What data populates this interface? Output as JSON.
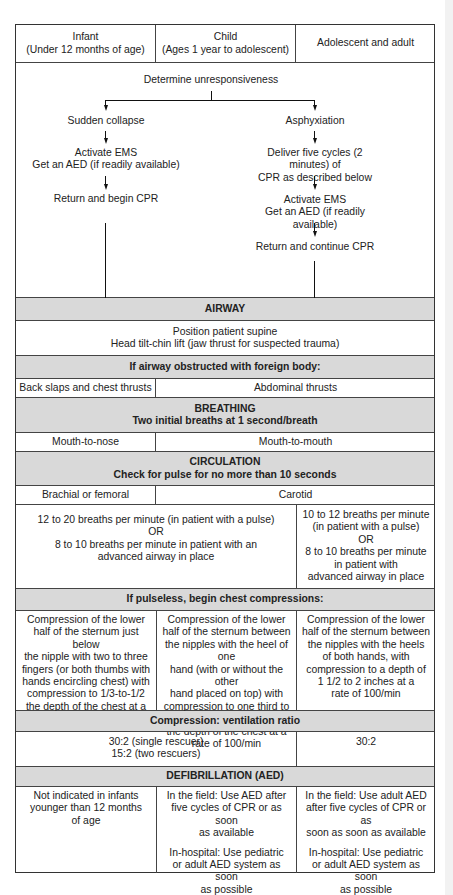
{
  "header": {
    "columns": [
      {
        "label": "Infant\n(Under 12 months of age)"
      },
      {
        "label": "Child\n(Ages 1 year to adolescent)"
      },
      {
        "label": "Adolescent and adult"
      }
    ]
  },
  "flowchart": {
    "start": "Determine unresponsiveness",
    "left_branch": {
      "title": "Sudden collapse",
      "step1": "Activate EMS\nGet an AED (if readily available)",
      "step2": "Return and begin CPR"
    },
    "right_branch": {
      "title": "Asphyxiation",
      "step1": "Deliver five cycles (2 minutes) of\nCPR as described below",
      "step2": "Activate EMS\nGet an AED (if readily available)",
      "step3": "Return and continue CPR"
    }
  },
  "airway": {
    "heading": "AIRWAY",
    "body": "Position patient supine\nHead tilt-chin lift (jaw thrust for suspected trauma)",
    "obstructed_heading": "If airway obstructed with foreign body:",
    "infant": "Back slaps and chest thrusts",
    "child_adult": "Abdominal thrusts"
  },
  "breathing": {
    "heading": "BREATHING\nTwo initial breaths at 1 second/breath",
    "infant": "Mouth-to-nose",
    "child_adult": "Mouth-to-mouth"
  },
  "circulation": {
    "heading": "CIRCULATION\nCheck for pulse for no more than 10 seconds",
    "infant": "Brachial or femoral",
    "child_adult": "Carotid",
    "rate_infant_child": "12 to 20 breaths per minute (in patient with a pulse)\nOR\n8 to 10 breaths per minute in patient with an\nadvanced airway in place",
    "rate_adult": "10 to 12 breaths per minute\n(in patient with a pulse)\nOR\n8 to 10 breaths per minute\nin patient with\nadvanced airway in place"
  },
  "compressions": {
    "heading": "If pulseless, begin chest compressions:",
    "infant": "Compression of the lower\nhalf of the sternum just below\nthe nipple with two to three\nfingers (or both thumbs with\nhands encircling chest) with\ncompression to 1/3-to-1/2\nthe depth of the chest at a\nrate of 100/min",
    "child": "Compression of the lower\nhalf of the sternum between\nthe nipples with the heel of one\nhand (with or without the other\nhand placed on top) with\ncompression to one third to half\nthe depth of the chest at a\nrate of 100/min",
    "adult": "Compression of the lower\nhalf of the sternum between\nthe nipples with the heels\nof both hands, with\ncompression to a depth of\n1 1/2 to 2 inches at a\nrate of 100/min"
  },
  "ratio": {
    "heading": "Compression: ventilation ratio",
    "infant_child": "30:2 (single rescuer)\n15:2 (two rescuers)",
    "adult": "30:2"
  },
  "defibrillation": {
    "heading": "DEFIBRILLATION (AED)",
    "infant": "Not indicated in infants\nyounger than 12 months\nof age",
    "child_field": "In the field: Use AED after\nfive cycles of CPR or as soon\nas available",
    "child_hospital": "In-hospital: Use pediatric\nor adult AED system as soon\nas possible",
    "adult_field": "In the field: Use adult AED\nafter five cycles of CPR or as\nsoon as soon as available",
    "adult_hospital": "In-hospital: Use pediatric\nor adult AED system as soon\nas possible"
  },
  "colors": {
    "band": "#d9d9d9",
    "border": "#333333",
    "text": "#222222"
  }
}
